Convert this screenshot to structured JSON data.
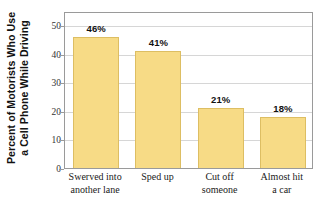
{
  "chart_data": {
    "type": "bar",
    "title": "",
    "xlabel": "",
    "ylabel": "Percent of Motorists Who Use a Cell Phone While Driving",
    "ylabel_lines": [
      "Percent of Motorists Who Use",
      "a Cell Phone While Driving"
    ],
    "categories": [
      "Swerved into another lane",
      "Sped up",
      "Cut off someone",
      "Almost hit a car"
    ],
    "category_lines": [
      [
        "Swerved into",
        "another lane"
      ],
      [
        "Sped up",
        ""
      ],
      [
        "Cut off",
        "someone"
      ],
      [
        "Almost hit",
        "a car"
      ]
    ],
    "values": [
      46,
      41,
      21,
      18
    ],
    "data_labels": [
      "46%",
      "41%",
      "21%",
      "18%"
    ],
    "ylim": [
      0,
      55
    ],
    "yticks": [
      0,
      10,
      20,
      30,
      40,
      50
    ],
    "ytick_labels": [
      "0",
      "10",
      "20",
      "30",
      "40",
      "50"
    ],
    "grid": true,
    "legend": "none",
    "bar_color": "#F7DB86",
    "bar_edge_color": "#DDBE63",
    "grid_color": "#D6D6D6",
    "frame_color": "#9A9A9A"
  }
}
